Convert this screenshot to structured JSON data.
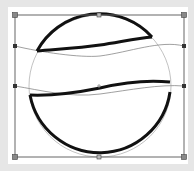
{
  "canvas": {
    "background": "#ffffff",
    "backdrop": "#e6e6e6"
  },
  "selection": {
    "bbox": {
      "x": 15,
      "y": 15,
      "width": 169,
      "height": 142
    },
    "frame_color": "#666666",
    "handles": [
      {
        "name": "top-left",
        "x": 15,
        "y": 15
      },
      {
        "name": "top-center",
        "x": 99,
        "y": 15
      },
      {
        "name": "top-right",
        "x": 184,
        "y": 15
      },
      {
        "name": "left-upper",
        "x": 15,
        "y": 46
      },
      {
        "name": "left-lower",
        "x": 15,
        "y": 86
      },
      {
        "name": "right-upper",
        "x": 184,
        "y": 46
      },
      {
        "name": "right-lower",
        "x": 184,
        "y": 86
      },
      {
        "name": "bottom-left",
        "x": 15,
        "y": 157
      },
      {
        "name": "bottom-center",
        "x": 99,
        "y": 157
      },
      {
        "name": "bottom-right",
        "x": 184,
        "y": 157
      }
    ]
  },
  "shape": {
    "type": "ball",
    "stroke": "#111111",
    "circle": {
      "cx": 100,
      "cy": 86,
      "r": 71
    },
    "band_top_y": 50,
    "band_bottom_y": 92
  }
}
